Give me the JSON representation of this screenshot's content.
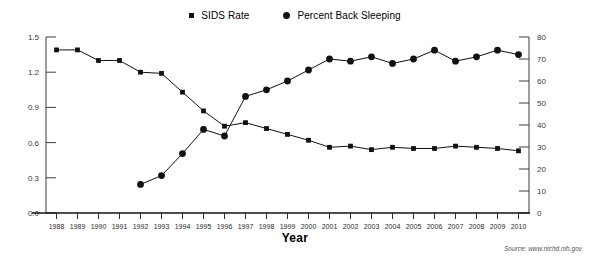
{
  "legend": {
    "position": "top-center",
    "entries": [
      {
        "label": "SIDS Rate",
        "marker": "square-marker-icon",
        "color": "#111111"
      },
      {
        "label": "Percent Back Sleeping",
        "marker": "circle-marker-icon",
        "color": "#111111"
      }
    ]
  },
  "axis": {
    "x_title": "Year",
    "left_ticks": [
      "0.0",
      "0.3",
      "0.6",
      "0.9",
      "1.2",
      "1.5"
    ],
    "right_ticks": [
      "0",
      "10",
      "20",
      "30",
      "40",
      "50",
      "60",
      "70",
      "80"
    ]
  },
  "source": "Source: www.nichd.nih.gov",
  "chart_data": {
    "type": "line",
    "title": "",
    "xlabel": "Year",
    "ylabel": "",
    "grid": false,
    "legend_position": "top-center",
    "categories": [
      "1988",
      "1989",
      "1990",
      "1991",
      "1992",
      "1993",
      "1994",
      "1995",
      "1996",
      "1997",
      "1998",
      "1999",
      "2000",
      "2001",
      "2002",
      "2003",
      "2004",
      "2005",
      "2006",
      "2007",
      "2008",
      "2009",
      "2010"
    ],
    "series": [
      {
        "name": "SIDS Rate",
        "axis": "left",
        "ylim": [
          0,
          1.5
        ],
        "marker": "square",
        "color": "#111111",
        "values": [
          1.39,
          1.39,
          1.3,
          1.3,
          1.2,
          1.19,
          1.03,
          0.87,
          0.74,
          0.77,
          0.72,
          0.67,
          0.62,
          0.56,
          0.57,
          0.54,
          0.56,
          0.55,
          0.55,
          0.57,
          0.56,
          0.55,
          0.53
        ]
      },
      {
        "name": "Percent Back Sleeping",
        "axis": "right",
        "ylim": [
          0,
          80
        ],
        "marker": "circle",
        "color": "#111111",
        "values": [
          null,
          null,
          null,
          null,
          13,
          17,
          27,
          38,
          35,
          53,
          56,
          60,
          65,
          70,
          69,
          71,
          68,
          70,
          74,
          69,
          71,
          74,
          72
        ]
      }
    ],
    "axis_left": {
      "label": "SIDS Rate",
      "range": [
        0,
        1.5
      ],
      "ticks": [
        0.0,
        0.3,
        0.6,
        0.9,
        1.2,
        1.5
      ]
    },
    "axis_right": {
      "label": "Percent Back Sleeping",
      "range": [
        0,
        80
      ],
      "ticks": [
        0,
        10,
        20,
        30,
        40,
        50,
        60,
        70,
        80
      ]
    }
  }
}
